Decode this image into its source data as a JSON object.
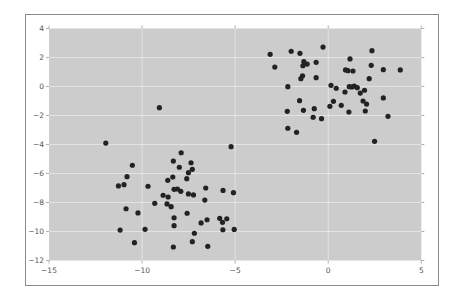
{
  "chart_data": {
    "type": "scatter",
    "title": "",
    "xlabel": "",
    "ylabel": "",
    "xlim": [
      -15,
      5
    ],
    "ylim": [
      -12,
      4
    ],
    "xticks": [
      -15,
      -10,
      -5,
      0,
      5
    ],
    "yticks": [
      4,
      2,
      0,
      -2,
      -4,
      -6,
      -8,
      -10,
      -12
    ],
    "xtick_labels": [
      "−15",
      "−10",
      "−5",
      "0",
      "5"
    ],
    "ytick_labels": [
      "4",
      "2",
      "0",
      "−2",
      "−4",
      "−6",
      "−8",
      "−10",
      "−12"
    ],
    "grid": true,
    "legend": null,
    "style": {
      "background": "#cccccc",
      "grid_color": "#e8e8e8",
      "marker_color": "#222222",
      "frame_color": "#888888"
    },
    "series": [
      {
        "name": "cluster_upper_right",
        "points": [
          [
            -3.12,
            2.22
          ],
          [
            -1.99,
            2.43
          ],
          [
            -1.52,
            2.29
          ],
          [
            -0.28,
            2.72
          ],
          [
            -2.87,
            1.34
          ],
          [
            -1.31,
            1.71
          ],
          [
            -1.13,
            1.55
          ],
          [
            -1.36,
            1.43
          ],
          [
            -0.65,
            1.67
          ],
          [
            -1.38,
            0.74
          ],
          [
            -1.47,
            0.54
          ],
          [
            -0.65,
            0.61
          ],
          [
            -2.17,
            -0.01
          ],
          [
            -1.54,
            -0.98
          ],
          [
            -1.33,
            -1.64
          ],
          [
            -2.2,
            -1.71
          ],
          [
            -0.75,
            -1.53
          ],
          [
            -0.81,
            -2.12
          ],
          [
            -0.36,
            -2.22
          ],
          [
            -2.17,
            -2.88
          ],
          [
            -1.7,
            -3.16
          ],
          [
            2.35,
            2.47
          ],
          [
            1.17,
            1.9
          ],
          [
            0.93,
            1.14
          ],
          [
            1.06,
            1.09
          ],
          [
            1.33,
            1.07
          ],
          [
            2.31,
            1.46
          ],
          [
            2.96,
            1.16
          ],
          [
            3.87,
            1.14
          ],
          [
            2.2,
            0.54
          ],
          [
            0.15,
            0.08
          ],
          [
            0.43,
            -0.12
          ],
          [
            1.13,
            -0.01
          ],
          [
            1.27,
            -0.03
          ],
          [
            1.4,
            0.03
          ],
          [
            1.56,
            -0.08
          ],
          [
            1.72,
            -0.45
          ],
          [
            1.95,
            -0.26
          ],
          [
            0.9,
            -0.38
          ],
          [
            2.96,
            -0.79
          ],
          [
            1.87,
            -1.0
          ],
          [
            2.06,
            -1.21
          ],
          [
            0.28,
            -1.02
          ],
          [
            0.09,
            -1.37
          ],
          [
            0.7,
            -1.3
          ],
          [
            1.99,
            -1.69
          ],
          [
            1.11,
            -1.76
          ],
          [
            3.21,
            -2.06
          ],
          [
            2.49,
            -3.78
          ]
        ]
      },
      {
        "name": "cluster_lower_left",
        "points": [
          [
            -11.95,
            -3.9
          ],
          [
            -9.07,
            -1.46
          ],
          [
            -10.52,
            -5.43
          ],
          [
            -10.81,
            -6.22
          ],
          [
            -11.27,
            -6.86
          ],
          [
            -10.97,
            -6.77
          ],
          [
            -9.68,
            -6.88
          ],
          [
            -10.86,
            -8.43
          ],
          [
            -10.22,
            -8.72
          ],
          [
            -9.32,
            -8.06
          ],
          [
            -11.18,
            -9.9
          ],
          [
            -9.84,
            -9.85
          ],
          [
            -10.41,
            -10.77
          ],
          [
            -5.22,
            -4.15
          ],
          [
            -7.9,
            -4.57
          ],
          [
            -8.32,
            -5.14
          ],
          [
            -7.37,
            -5.26
          ],
          [
            -8.0,
            -5.57
          ],
          [
            -7.3,
            -5.71
          ],
          [
            -7.51,
            -5.94
          ],
          [
            -8.35,
            -6.24
          ],
          [
            -8.62,
            -6.47
          ],
          [
            -7.6,
            -6.36
          ],
          [
            -8.28,
            -7.09
          ],
          [
            -8.1,
            -7.07
          ],
          [
            -7.92,
            -7.23
          ],
          [
            -8.87,
            -7.5
          ],
          [
            -8.6,
            -7.62
          ],
          [
            -7.51,
            -7.41
          ],
          [
            -7.24,
            -7.48
          ],
          [
            -6.58,
            -7.0
          ],
          [
            -5.65,
            -7.17
          ],
          [
            -5.09,
            -7.32
          ],
          [
            -6.63,
            -7.83
          ],
          [
            -8.66,
            -8.1
          ],
          [
            -8.44,
            -8.29
          ],
          [
            -7.58,
            -8.74
          ],
          [
            -8.28,
            -9.05
          ],
          [
            -6.51,
            -9.19
          ],
          [
            -6.83,
            -9.41
          ],
          [
            -5.83,
            -9.09
          ],
          [
            -5.68,
            -9.37
          ],
          [
            -5.45,
            -9.12
          ],
          [
            -8.28,
            -9.6
          ],
          [
            -5.66,
            -9.88
          ],
          [
            -5.05,
            -9.86
          ],
          [
            -7.19,
            -10.12
          ],
          [
            -7.3,
            -10.7
          ],
          [
            -8.32,
            -11.07
          ],
          [
            -6.47,
            -11.02
          ]
        ]
      }
    ]
  }
}
